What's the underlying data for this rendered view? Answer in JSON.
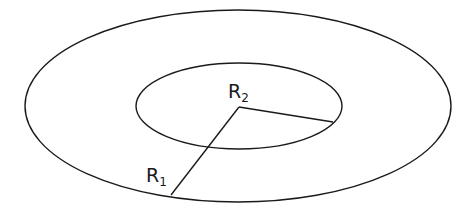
{
  "diagram": {
    "stroke_color": "#1a1a1a",
    "outer_ellipse": {
      "cx": 238,
      "cy": 106,
      "rx": 213,
      "ry": 96
    },
    "inner_ellipse": {
      "cx": 239,
      "cy": 106,
      "rx": 103,
      "ry": 43
    },
    "center": {
      "x": 239,
      "y": 107
    },
    "radius_R1": {
      "end_x": 171,
      "end_y": 195,
      "label_main": "R",
      "label_sub": "1"
    },
    "radius_R2": {
      "end_x": 333,
      "end_y": 122,
      "label_main": "R",
      "label_sub": "2"
    }
  }
}
